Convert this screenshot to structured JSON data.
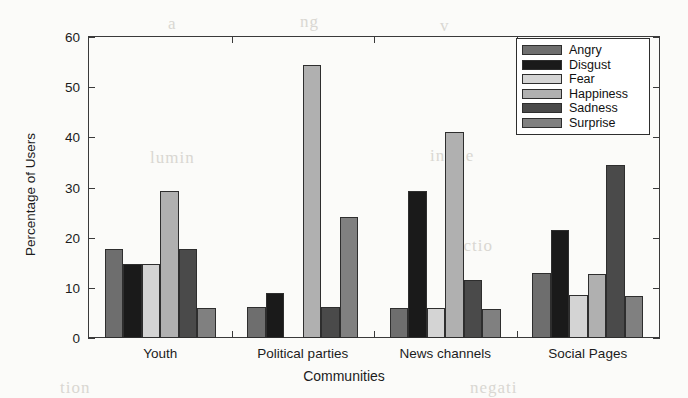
{
  "chart_data": {
    "type": "bar",
    "title": "",
    "xlabel": "Communities",
    "ylabel": "Percentage of Users",
    "ylim": [
      0,
      60
    ],
    "yticks": [
      0,
      10,
      20,
      30,
      40,
      50,
      60
    ],
    "grid": false,
    "legend_position": "top-right",
    "categories": [
      "Youth",
      "Political parties",
      "News channels",
      "Social Pages"
    ],
    "series": [
      {
        "name": "Angry",
        "color": "#6e6e6e",
        "values": [
          17.8,
          6.2,
          5.9,
          13.0
        ]
      },
      {
        "name": "Disgust",
        "color": "#1a1a1a",
        "values": [
          14.7,
          9.0,
          29.4,
          21.5
        ]
      },
      {
        "name": "Fear",
        "color": "#d4d4d4",
        "values": [
          14.8,
          0.0,
          5.9,
          8.5
        ]
      },
      {
        "name": "Happiness",
        "color": "#b0b0b0",
        "values": [
          29.4,
          54.5,
          41.0,
          12.8
        ]
      },
      {
        "name": "Sadness",
        "color": "#4a4a4a",
        "values": [
          17.8,
          6.2,
          11.6,
          34.4
        ]
      },
      {
        "name": "Surprise",
        "color": "#808080",
        "values": [
          6.0,
          24.2,
          5.8,
          8.4
        ]
      }
    ]
  },
  "legend": {
    "items": [
      "Angry",
      "Disgust",
      "Fear",
      "Happiness",
      "Sadness",
      "Surprise"
    ]
  },
  "artifacts": {
    "bleed": [
      "a",
      "ng",
      "v",
      "lumin",
      "in the",
      "ectio",
      "tion",
      "negati"
    ]
  }
}
